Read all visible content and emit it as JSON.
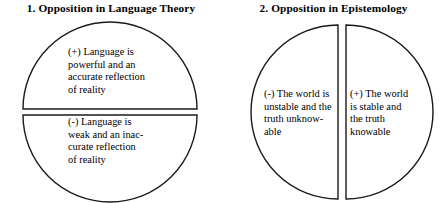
{
  "figure": {
    "background_color": "#ffffff",
    "stroke_color": "#1a1a1a",
    "panels": [
      {
        "title": "1. Opposition in Language Theory",
        "shape": "circle-split-horizontal",
        "segments": [
          {
            "polarity": "(+)",
            "position": "top",
            "text": "(+) Language is\npowerful and an\naccurate reflection\nof reality"
          },
          {
            "polarity": "(-)",
            "position": "bottom",
            "text": "(-) Language is\nweak and an inac-\ncurate reflection\nof reality"
          }
        ]
      },
      {
        "title": "2. Opposition in Epistemology",
        "shape": "circle-split-vertical",
        "segments": [
          {
            "polarity": "(-)",
            "position": "left",
            "text": "(-) The world is\nunstable and the\ntruth unknow-\nable"
          },
          {
            "polarity": "(+)",
            "position": "right",
            "text": "(+) The world\nis stable and\nthe truth\nknowable"
          }
        ]
      }
    ]
  }
}
